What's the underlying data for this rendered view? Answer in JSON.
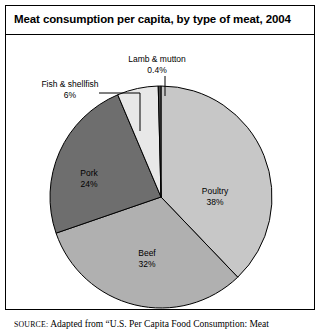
{
  "figure": {
    "title": "Meat consumption per capita, by type of meat, 2004",
    "source_prefix": "SOURCE:",
    "source_text": " Adapted from “U.S. Per Capita Food Consumption: Meat"
  },
  "chart_data": {
    "type": "pie",
    "title": "Meat consumption per capita, by type of meat, 2004",
    "xlabel": "",
    "ylabel": "",
    "units": "percent",
    "start_angle_deg": 0,
    "direction": "clockwise",
    "legend": "none (labels placed on slices and via leader lines)",
    "grid": false,
    "categories": [
      "Poultry",
      "Beef",
      "Pork",
      "Fish & shellfish",
      "Lamb & mutton"
    ],
    "values": [
      38,
      32,
      24,
      6,
      0.4
    ],
    "colors": [
      "#c7c7c7",
      "#b0b0b0",
      "#6e6e6e",
      "#e8e8e8",
      "#4a4a4a"
    ],
    "slices": [
      {
        "name": "Poultry",
        "value": 38,
        "label": "Poultry",
        "value_label": "38%",
        "color": "#c7c7c7",
        "label_placement": "inside"
      },
      {
        "name": "Beef",
        "value": 32,
        "label": "Beef",
        "value_label": "32%",
        "color": "#b0b0b0",
        "label_placement": "inside"
      },
      {
        "name": "Pork",
        "value": 24,
        "label": "Pork",
        "value_label": "24%",
        "color": "#6e6e6e",
        "label_placement": "inside"
      },
      {
        "name": "Fish & shellfish",
        "value": 6,
        "label": "Fish & shellfish",
        "value_label": "6%",
        "color": "#e8e8e8",
        "label_placement": "callout-left"
      },
      {
        "name": "Lamb & mutton",
        "value": 0.4,
        "label": "Lamb & mutton",
        "value_label": "0.4%",
        "color": "#4a4a4a",
        "label_placement": "callout-top"
      }
    ]
  }
}
